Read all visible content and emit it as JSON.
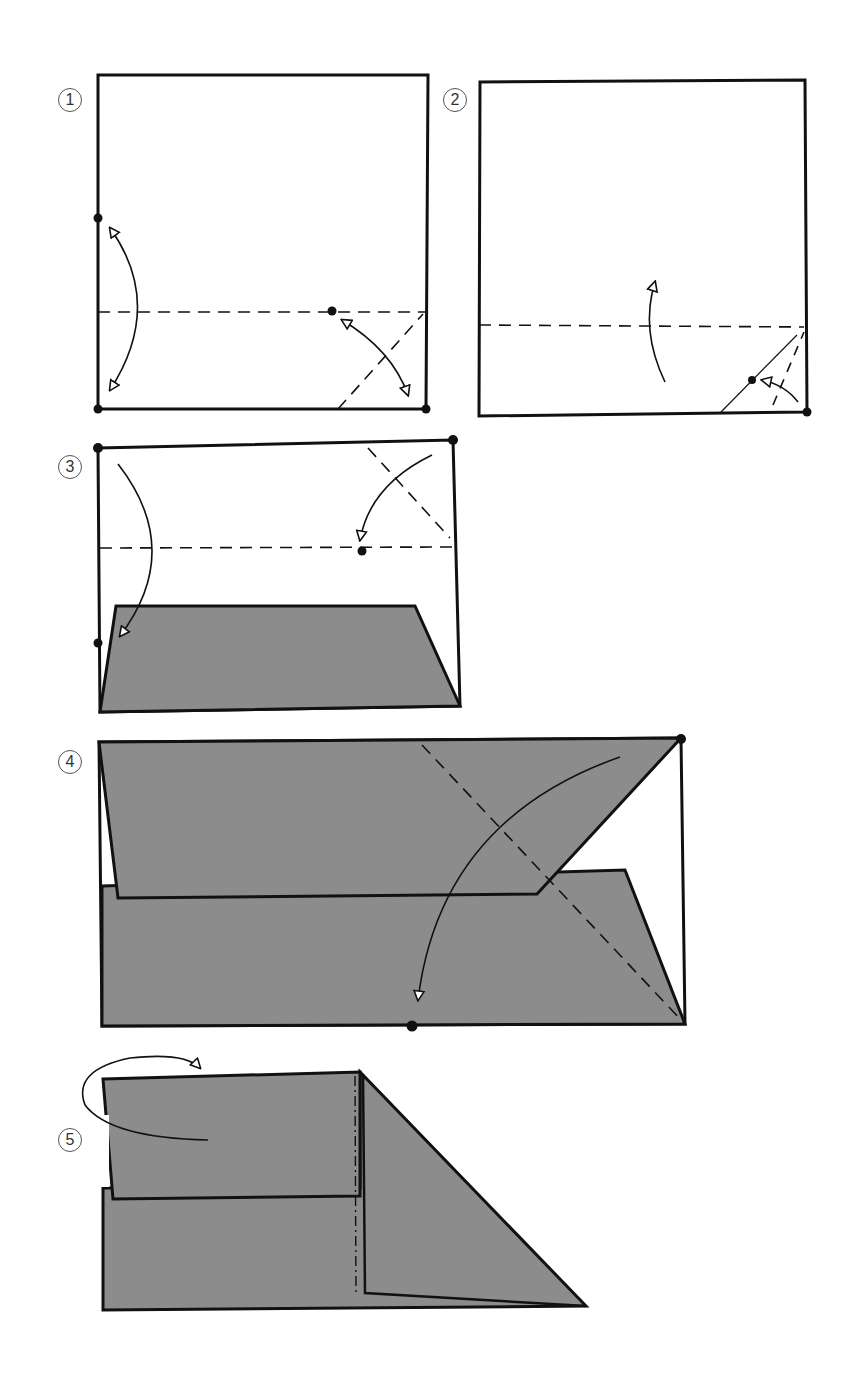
{
  "colors": {
    "paper_front": "#ffffff",
    "paper_back": "#8c8c8c",
    "line": "#111111"
  },
  "steps": [
    {
      "number": "1",
      "description": "Square; valley fold bottom edge up to marked point (fold and unfold); valley fold bottom-right corner diagonally to marked point (fold and unfold)"
    },
    {
      "number": "2",
      "description": "Square with horizontal valley fold and small corner fold at bottom-right; fold bottom edge up"
    },
    {
      "number": "3",
      "description": "Bottom strip folded up (colored side shown); fold top-left corner down to marked point; fold top-right corner diagonally"
    },
    {
      "number": "4",
      "description": "Rectangle mostly colored; fold top-right corner diagonally down to bottom marked point"
    },
    {
      "number": "5",
      "description": "Mountain fold along vertical dash-dot line; turn model over"
    }
  ],
  "legend": {
    "dashed_line": "valley fold",
    "dash_dot_line": "mountain fold",
    "dot": "reference point",
    "hollow_arrow": "fold direction"
  }
}
